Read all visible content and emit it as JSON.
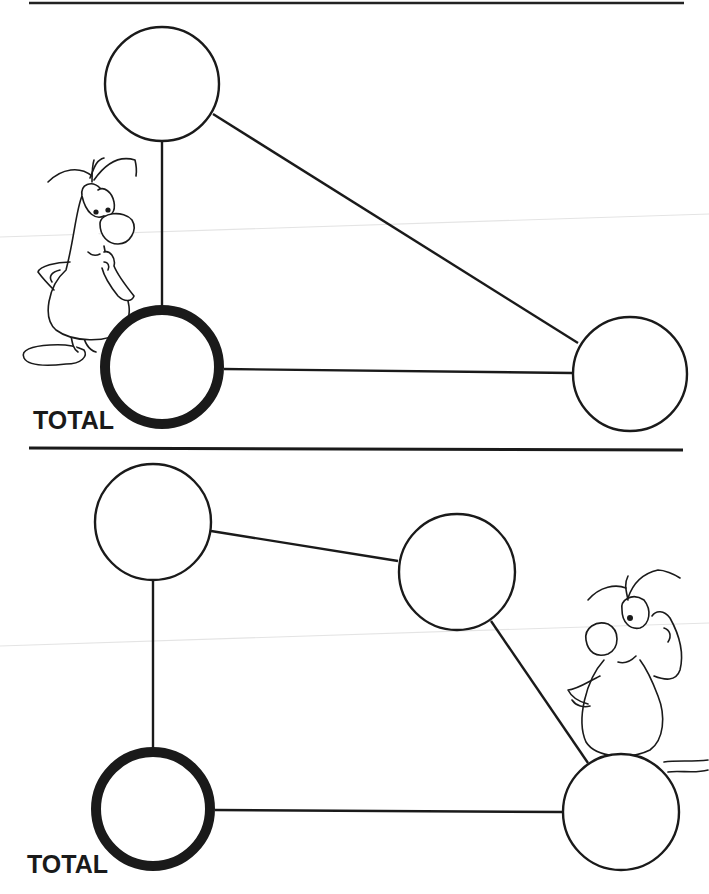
{
  "worksheet": {
    "colors": {
      "ink": "#1a1a1a",
      "paper": "#ffffff",
      "scan_line": "#e2e2e2"
    },
    "divider": {
      "x1": 29,
      "y1": 448,
      "x2": 683,
      "y2": 450
    },
    "puzzles": [
      {
        "id": "puzzle-top",
        "total_label": "TOTAL",
        "nodes": [
          {
            "name": "node-top",
            "cx": 162,
            "cy": 84,
            "r": 58,
            "bold": false,
            "value": ""
          },
          {
            "name": "node-total",
            "cx": 162,
            "cy": 367,
            "r": 58,
            "bold": true,
            "value": ""
          },
          {
            "name": "node-right",
            "cx": 630,
            "cy": 374,
            "r": 58,
            "bold": false,
            "value": ""
          }
        ],
        "edges": [
          {
            "from": 0,
            "to": 1
          },
          {
            "from": 0,
            "to": 2
          },
          {
            "from": 1,
            "to": 2
          }
        ],
        "mascot": {
          "position": "left",
          "pose": "hand-on-chin"
        }
      },
      {
        "id": "puzzle-bottom",
        "total_label": "TOTAL",
        "nodes": [
          {
            "name": "node-top-left",
            "cx": 153,
            "cy": 522,
            "r": 59,
            "bold": false,
            "value": ""
          },
          {
            "name": "node-middle-right",
            "cx": 457,
            "cy": 572,
            "r": 59,
            "bold": false,
            "value": ""
          },
          {
            "name": "node-total",
            "cx": 153,
            "cy": 809,
            "r": 58,
            "bold": true,
            "value": ""
          },
          {
            "name": "node-bottom-right",
            "cx": 621,
            "cy": 812,
            "r": 59,
            "bold": false,
            "value": ""
          }
        ],
        "edges": [
          {
            "from": 0,
            "to": 1
          },
          {
            "from": 0,
            "to": 2
          },
          {
            "from": 1,
            "to": 3
          },
          {
            "from": 2,
            "to": 3
          }
        ],
        "mascot": {
          "position": "right",
          "pose": "scratching-head"
        }
      }
    ]
  }
}
